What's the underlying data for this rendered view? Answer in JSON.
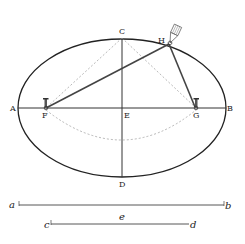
{
  "figure": {
    "colors": {
      "ink": "#222222",
      "dashed": "#8a8a8a",
      "background": "#ffffff"
    },
    "ellipse": {
      "cx": 122,
      "cy": 108,
      "rx": 104,
      "ry": 69
    },
    "points": {
      "A": {
        "label": "A",
        "x": 12,
        "y": 112
      },
      "B": {
        "label": "B",
        "x": 227,
        "y": 112
      },
      "C": {
        "label": "C",
        "x": 119,
        "y": 35
      },
      "D": {
        "label": "D",
        "x": 119,
        "y": 187
      },
      "E": {
        "label": "E",
        "x": 124,
        "y": 117
      },
      "F": {
        "label": "F",
        "x": 42,
        "y": 118
      },
      "G": {
        "label": "G",
        "x": 193,
        "y": 118
      },
      "H": {
        "label": "H",
        "x": 159,
        "y": 42
      }
    },
    "scale_lines": {
      "ab": {
        "start_label": "a",
        "end_label": "b"
      },
      "cd": {
        "start_label": "c",
        "mid_label": "e",
        "end_label": "d"
      }
    }
  }
}
